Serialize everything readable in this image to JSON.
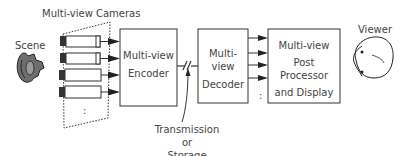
{
  "diagram": {
    "cameras_label": "Multi-view Cameras",
    "scene_label": "Scene",
    "viewer_label": "Viewer",
    "encoder": {
      "line1": "Multi-view",
      "line2": "Encoder"
    },
    "decoder": {
      "line1": "Multi-view",
      "line2": "Decoder"
    },
    "postprocessor": {
      "line1": "Multi-view",
      "line2": "Post Processor",
      "line3": "and Display"
    },
    "channel_label": {
      "line1": "Transmission or",
      "line2": "Storage Media"
    },
    "ellipsis": ":",
    "camera_count_visible": 4,
    "icons": {
      "scene": "scene-object-icon",
      "camera": "video-camera-icon",
      "viewer": "viewer-head-icon",
      "channel_break": "break-symbol-icon"
    },
    "colors": {
      "line": "#333333",
      "text": "#444444",
      "background": "#ffffff"
    }
  }
}
